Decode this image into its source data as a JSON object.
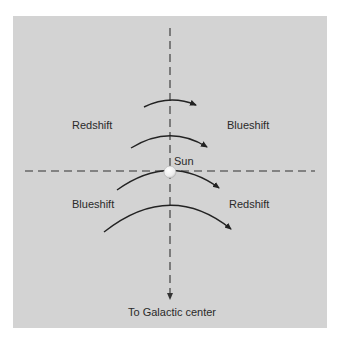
{
  "diagram": {
    "colors": {
      "background": "#ffffff",
      "panel": "#d3d3d3",
      "stroke": "#222222",
      "dash": "#333333",
      "sun_fill": "#f4f4f4"
    },
    "labels": {
      "upper_left": "Redshift",
      "upper_right": "Blueshift",
      "lower_left": "Blueshift",
      "lower_right": "Redshift",
      "sun": "Sun",
      "galactic_center": "To Galactic center"
    },
    "axes": {
      "horizontal": {
        "style": "dashed",
        "x1": 25,
        "x2": 315,
        "y": 171
      },
      "vertical": {
        "style": "dashed",
        "x": 170,
        "y1": 28,
        "y2": 300,
        "arrow": "down"
      }
    },
    "orbit_arrows": [
      {
        "id": "arc-1",
        "direction": "right",
        "from": [
          144,
          107
        ],
        "apex": [
          170,
          100
        ],
        "to": [
          196,
          105
        ]
      },
      {
        "id": "arc-2",
        "direction": "right",
        "from": [
          131,
          148
        ],
        "apex": [
          170,
          136
        ],
        "to": [
          207,
          147
        ]
      },
      {
        "id": "arc-3",
        "direction": "right",
        "from": [
          117,
          190
        ],
        "apex": [
          170,
          171
        ],
        "to": [
          219,
          188
        ]
      },
      {
        "id": "arc-4",
        "direction": "right",
        "from": [
          104,
          232
        ],
        "apex": [
          170,
          206
        ],
        "to": [
          231,
          229
        ]
      }
    ],
    "sun": {
      "cx": 170,
      "cy": 172,
      "r": 6
    }
  }
}
